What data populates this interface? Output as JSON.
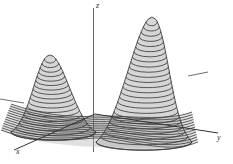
{
  "figure": {
    "title": "",
    "background_color": "#ffffff",
    "width": 233,
    "height": 164,
    "style": "grayscale line drawing"
  },
  "axes": {
    "z": {
      "label": "z",
      "label_x": 96,
      "label_y": 2,
      "line": {
        "x1": 93.5,
        "y1": 8,
        "x2": 93.5,
        "y2": 152
      },
      "color": "#555555"
    },
    "x": {
      "label": "x",
      "label_x": 16,
      "label_y": 148,
      "line": {
        "x1": 95,
        "y1": 114,
        "x2": 14,
        "y2": 150
      },
      "color": "#333333"
    },
    "y": {
      "label": "y",
      "label_x": 217,
      "label_y": 134,
      "line": {
        "x1": 95,
        "y1": 114,
        "x2": 218,
        "y2": 133
      },
      "color": "#333333"
    }
  },
  "ticks": [
    {
      "name": "left-edge-tick",
      "x1": 0,
      "y1": 99,
      "x2": 24,
      "y2": 103
    },
    {
      "name": "right-edge-tick",
      "x1": 188,
      "y1": 76,
      "x2": 208,
      "y2": 72
    }
  ],
  "chart_data": {
    "type": "surface",
    "title": "",
    "xlabel": "x",
    "ylabel": "y",
    "zlabel": "z",
    "projection": "oblique 3D",
    "grid": false,
    "legend": null,
    "surface_color": "#b4b4b4",
    "contour_line_color": "#3c3c3c",
    "peaks": [
      {
        "name": "left-peak",
        "apex_x": 50,
        "apex_y": 55,
        "base_left_x": 11,
        "base_right_x": 96,
        "base_y": 132,
        "relative_height": 0.62,
        "contour_count": 18
      },
      {
        "name": "right-peak",
        "apex_x": 152,
        "apex_y": 17,
        "base_left_x": 96,
        "base_right_x": 192,
        "base_y": 142,
        "relative_height": 1.0,
        "contour_count": 25
      }
    ],
    "saddle": {
      "name": "valley-saddle",
      "x": 95,
      "y": 114,
      "relative_height": 0.02
    }
  }
}
